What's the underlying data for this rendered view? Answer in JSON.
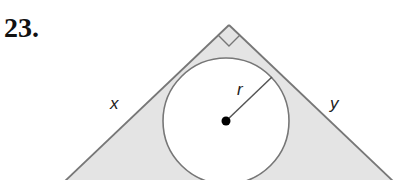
{
  "problem": {
    "number": "23."
  },
  "diagram": {
    "type": "right triangle with inscribed circle",
    "labels": {
      "left_leg": "x",
      "right_leg": "y",
      "radius": "r"
    },
    "colors": {
      "stroke": "#777777",
      "shade": "#e4e4e4",
      "center_dot": "#000000",
      "background": "#ffffff"
    }
  }
}
